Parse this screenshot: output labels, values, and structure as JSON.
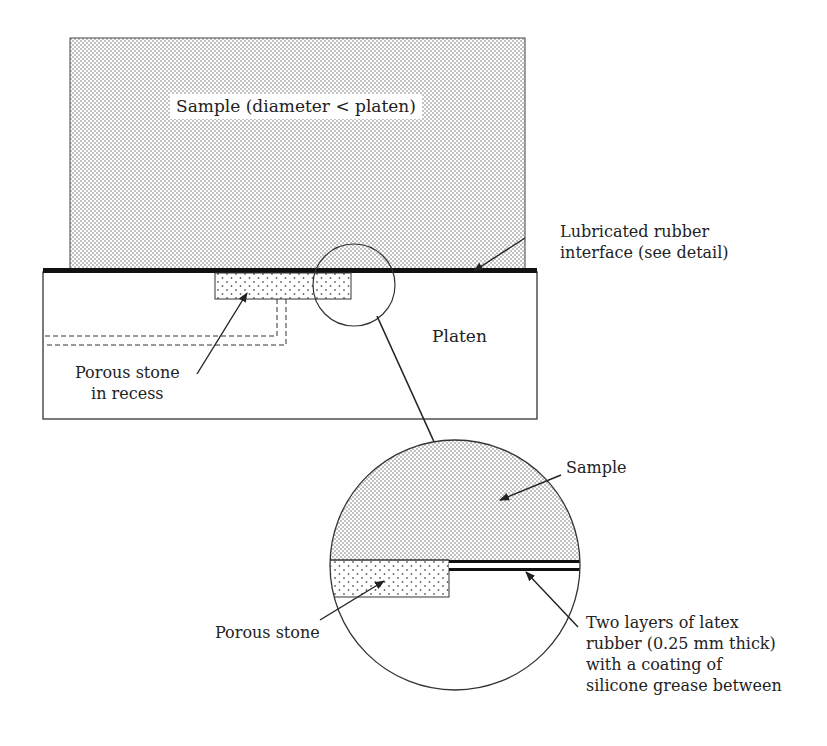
{
  "diagram": {
    "labels": {
      "sample_main": "Sample (diameter < platen)",
      "lubricated_interface_line1": "Lubricated rubber",
      "lubricated_interface_line2": "interface (see detail)",
      "platen": "Platen",
      "porous_stone_recess_line1": "Porous stone",
      "porous_stone_recess_line2": "in recess",
      "detail_sample": "Sample",
      "detail_porous_stone": "Porous stone",
      "latex_line1": "Two layers of latex",
      "latex_line2": "rubber (0.25 mm thick)",
      "latex_line3": "with a coating of",
      "latex_line4": "silicone grease between"
    },
    "colors": {
      "stroke": "#333333",
      "interface": "#111111",
      "fill": "#ffffff",
      "dots": "#555555"
    }
  }
}
